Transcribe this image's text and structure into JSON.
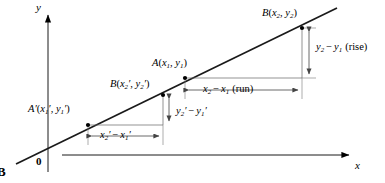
{
  "figure": {
    "tag": "B",
    "background_color": "#ffffff",
    "ink_color": "#000000",
    "thin_line_color": "#555555"
  },
  "axes": {
    "y_label": "y",
    "x_label": "x",
    "origin_label": "0",
    "x_axis": {
      "x1": 62,
      "y1": 155,
      "x2": 352,
      "y2": 155
    },
    "y_axis": {
      "x1": 48,
      "y1": 170,
      "x2": 48,
      "y2": 12
    }
  },
  "line": {
    "name": "slope-line",
    "x1": 16,
    "y1": 164,
    "x2": 337,
    "y2": 8
  },
  "points": [
    {
      "id": "A-prime",
      "label_main": "A",
      "prime": true,
      "label_coords": "(x'1, y'1)",
      "x": 88,
      "y": 125
    },
    {
      "id": "B-prime",
      "label_main": "B",
      "prime": false,
      "label_coords": "(x'2, y'2)",
      "x": 163,
      "y": 95
    },
    {
      "id": "A",
      "label_main": "A",
      "prime": false,
      "label_coords": "(x1, y1)",
      "x": 185,
      "y": 78
    },
    {
      "id": "B",
      "label_main": "B",
      "prime": false,
      "label_coords": "(x2, y2)",
      "x": 302,
      "y": 28
    }
  ],
  "labels": {
    "a_prime": {
      "base": "A",
      "prime": "′",
      "open": "(",
      "x": "x",
      "xsub": "1",
      "xprime": "′",
      "comma": ", ",
      "y": "y",
      "ysub": "1",
      "yprime": "′",
      "close": ")"
    },
    "b_prime": {
      "base": "B",
      "open": "(",
      "x": "x",
      "xsub": "2",
      "xprime": "′",
      "comma": ", ",
      "y": "y",
      "ysub": "2",
      "yprime": "′",
      "close": ")"
    },
    "a": {
      "base": "A",
      "open": "(",
      "x": "x",
      "xsub": "1",
      "comma": ", ",
      "y": "y",
      "ysub": "1",
      "close": ")"
    },
    "b": {
      "base": "B",
      "open": "(",
      "x": "x",
      "xsub": "2",
      "comma": ", ",
      "y": "y",
      "ysub": "2",
      "close": ")"
    }
  },
  "measures": {
    "rise": {
      "name": "rise-measure",
      "minuend": "y",
      "minuend_sub": "2",
      "subtrahend": "y",
      "subtrahend_sub": "1",
      "annotation": "(rise)",
      "orientation": "vertical",
      "x": 302,
      "y_top": 28,
      "y_bottom": 78,
      "text_x": 312,
      "text_y": 48
    },
    "run": {
      "name": "run-measure",
      "minuend": "x",
      "minuend_sub": "2",
      "subtrahend": "x",
      "subtrahend_sub": "1",
      "annotation": "(run)",
      "orientation": "horizontal",
      "y": 90,
      "x_left": 185,
      "x_right": 302,
      "text_x": 243,
      "text_y": 90
    },
    "rise_prime": {
      "name": "rise-prime-measure",
      "minuend": "y",
      "minuend_sub": "2",
      "minuend_prime": "′",
      "subtrahend": "y",
      "subtrahend_sub": "1",
      "subtrahend_prime": "′",
      "orientation": "vertical",
      "x": 163,
      "y_top": 95,
      "y_bottom": 125,
      "text_x": 172,
      "text_y": 111
    },
    "run_prime": {
      "name": "run-prime-measure",
      "minuend": "x",
      "minuend_sub": "2",
      "minuend_prime": "′",
      "subtrahend": "x",
      "subtrahend_sub": "1",
      "subtrahend_prime": "′",
      "orientation": "horizontal",
      "y": 136,
      "x_left": 88,
      "x_right": 163,
      "text_x": 126,
      "text_y": 136
    }
  },
  "minus_sign": "−"
}
